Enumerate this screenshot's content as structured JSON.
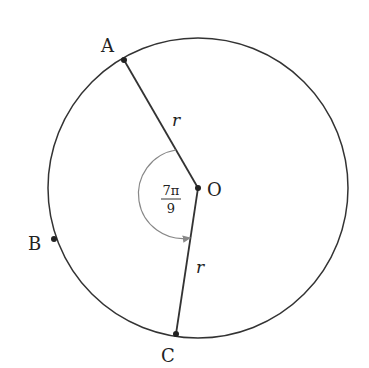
{
  "diagram": {
    "type": "circle-central-angle",
    "center": {
      "label": "O"
    },
    "points": [
      {
        "label": "A"
      },
      {
        "label": "B"
      },
      {
        "label": "C"
      }
    ],
    "radius_labels": [
      "r",
      "r"
    ],
    "angle": {
      "numerator": "7π",
      "denominator": "9",
      "description": "central angle from OA to OC"
    },
    "colors": {
      "stroke": "#333333",
      "angle_arc": "#888888",
      "background": "#ffffff"
    }
  }
}
